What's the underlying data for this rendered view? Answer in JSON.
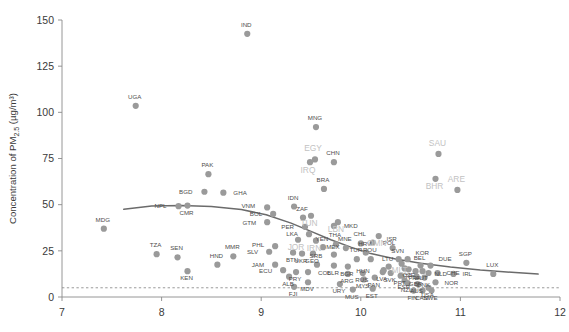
{
  "chart_data": {
    "type": "scatter",
    "title": "",
    "xlabel": "",
    "ylabel": "Concentration of PM2.5 (µg/m³)",
    "ylabel_parts": {
      "pre": "Concentration of PM",
      "sub": "2.5",
      "post": " (µg/m³)"
    },
    "xlim": [
      7,
      12
    ],
    "ylim": [
      0,
      150
    ],
    "xticks": [
      "7",
      "8",
      "9",
      "10",
      "11",
      "12"
    ],
    "yticks": [
      "0",
      "25",
      "50",
      "75",
      "100",
      "125",
      "150"
    ],
    "grid": false,
    "legend": "none",
    "guideline": {
      "label": "WHO guideline",
      "y": 5,
      "style": "dashed"
    },
    "trendline": {
      "style": "solid",
      "color": "#6b6b6b",
      "points": [
        [
          7.62,
          47.5
        ],
        [
          7.9,
          49.2
        ],
        [
          8.2,
          49.6
        ],
        [
          8.5,
          49.0
        ],
        [
          8.8,
          47.4
        ],
        [
          9.05,
          44.5
        ],
        [
          9.3,
          40.0
        ],
        [
          9.5,
          35.5
        ],
        [
          9.7,
          31.0
        ],
        [
          9.9,
          27.0
        ],
        [
          10.1,
          23.5
        ],
        [
          10.35,
          20.6
        ],
        [
          10.6,
          18.3
        ],
        [
          10.9,
          16.2
        ],
        [
          11.2,
          14.6
        ],
        [
          11.55,
          13.2
        ],
        [
          11.78,
          12.4
        ]
      ]
    },
    "points": [
      {
        "code": "MDG",
        "x": 7.42,
        "y": 37.0,
        "lx": -1,
        "ly": -7,
        "hl": false
      },
      {
        "code": "UGA",
        "x": 7.74,
        "y": 103.5,
        "lx": -1,
        "ly": -7,
        "hl": false
      },
      {
        "code": "TZA",
        "x": 7.95,
        "y": 23.2,
        "lx": -1,
        "ly": -7,
        "hl": false
      },
      {
        "code": "NPL",
        "x": 8.17,
        "y": 49.2,
        "lx": -12,
        "ly": 2,
        "hl": false
      },
      {
        "code": "CMR",
        "x": 8.26,
        "y": 49.5,
        "lx": -1,
        "ly": 9,
        "hl": false
      },
      {
        "code": "SEN",
        "x": 8.16,
        "y": 21.5,
        "lx": -1,
        "ly": -7,
        "hl": false
      },
      {
        "code": "KEN",
        "x": 8.26,
        "y": 14.0,
        "lx": -1,
        "ly": 9,
        "hl": false
      },
      {
        "code": "PAK",
        "x": 8.47,
        "y": 66.5,
        "lx": -1,
        "ly": -7,
        "hl": false
      },
      {
        "code": "BGD",
        "x": 8.43,
        "y": 57.0,
        "lx": -12,
        "ly": 2,
        "hl": false
      },
      {
        "code": "GHA",
        "x": 8.62,
        "y": 56.5,
        "lx": 10,
        "ly": 2.5,
        "hl": false
      },
      {
        "code": "MMR",
        "x": 8.72,
        "y": 22.0,
        "lx": -1,
        "ly": -7,
        "hl": false
      },
      {
        "code": "HND",
        "x": 8.56,
        "y": 17.5,
        "lx": -1,
        "ly": -7,
        "hl": false
      },
      {
        "code": "IND",
        "x": 8.86,
        "y": 142.5,
        "lx": -1,
        "ly": -7,
        "hl": false
      },
      {
        "code": "VNM",
        "x": 9.06,
        "y": 48.5,
        "lx": -12,
        "ly": 1,
        "hl": false
      },
      {
        "code": "BOL",
        "x": 9.12,
        "y": 45.0,
        "lx": -11,
        "ly": 2,
        "hl": false
      },
      {
        "code": "GTM",
        "x": 9.06,
        "y": 40.5,
        "lx": -11,
        "ly": 3,
        "hl": false
      },
      {
        "code": "PHL",
        "x": 9.14,
        "y": 27.5,
        "lx": -11,
        "ly": 1,
        "hl": false
      },
      {
        "code": "SLV",
        "x": 9.08,
        "y": 24.5,
        "lx": -11,
        "ly": 2,
        "hl": false
      },
      {
        "code": "JAM",
        "x": 9.14,
        "y": 17.5,
        "lx": -11,
        "ly": 2,
        "hl": false
      },
      {
        "code": "ECU",
        "x": 9.22,
        "y": 14.5,
        "lx": -11,
        "ly": 3,
        "hl": false
      },
      {
        "code": "IDN",
        "x": 9.33,
        "y": 49.0,
        "lx": -1,
        "ly": -7,
        "hl": false
      },
      {
        "code": "ZAF",
        "x": 9.42,
        "y": 43.0,
        "lx": -1,
        "ly": -7,
        "hl": false
      },
      {
        "code": "PER",
        "x": 9.44,
        "y": 38.0,
        "lx": -11,
        "ly": 2,
        "hl": false
      },
      {
        "code": "LKA",
        "x": 9.48,
        "y": 34.0,
        "lx": -11,
        "ly": 2,
        "hl": false
      },
      {
        "code": "BTN",
        "x": 9.32,
        "y": 24.0,
        "lx": -1,
        "ly": 9,
        "hl": false
      },
      {
        "code": "UKR",
        "x": 9.41,
        "y": 23.5,
        "lx": -1,
        "ly": 9,
        "hl": false
      },
      {
        "code": "GEO",
        "x": 9.52,
        "y": 23.5,
        "lx": -1,
        "ly": 9,
        "hl": false
      },
      {
        "code": "PRY",
        "x": 9.35,
        "y": 13.5,
        "lx": -1,
        "ly": 9,
        "hl": false
      },
      {
        "code": "ALB",
        "x": 9.28,
        "y": 11.0,
        "lx": -1,
        "ly": 9,
        "hl": false
      },
      {
        "code": "COL",
        "x": 9.47,
        "y": 13.5,
        "lx": 10,
        "ly": 2.5,
        "hl": false
      },
      {
        "code": "SRB",
        "x": 9.56,
        "y": 17.5,
        "lx": -1,
        "ly": -7,
        "hl": false
      },
      {
        "code": "MDV",
        "x": 9.47,
        "y": 8.0,
        "lx": -1,
        "ly": 9,
        "hl": false
      },
      {
        "code": "FJI",
        "x": 9.33,
        "y": 5.5,
        "lx": -1,
        "ly": 9,
        "hl": false
      },
      {
        "code": "MNG",
        "x": 9.55,
        "y": 92.0,
        "lx": -1,
        "ly": -7,
        "hl": false
      },
      {
        "code": "EGY",
        "x": 9.54,
        "y": 74.5,
        "lx": -2,
        "ly": -8,
        "hl": true
      },
      {
        "code": "IRQ",
        "x": 9.49,
        "y": 73.0,
        "lx": -2,
        "ly": 11,
        "hl": true
      },
      {
        "code": "CHN",
        "x": 9.73,
        "y": 73.0,
        "lx": -1,
        "ly": -7,
        "hl": false
      },
      {
        "code": "BRA",
        "x": 9.63,
        "y": 58.5,
        "lx": -1,
        "ly": -7,
        "hl": false
      },
      {
        "code": "TUN",
        "x": 9.5,
        "y": 44.0,
        "lx": -2,
        "ly": 10,
        "hl": true
      },
      {
        "code": "JOR",
        "x": 9.37,
        "y": 31.0,
        "lx": -2,
        "ly": 10,
        "hl": true
      },
      {
        "code": "IRN",
        "x": 9.55,
        "y": 30.5,
        "lx": -2,
        "ly": 10,
        "hl": true
      },
      {
        "code": "LBN",
        "x": 9.77,
        "y": 40.5,
        "lx": -2,
        "ly": 10,
        "hl": true
      },
      {
        "code": "MKD",
        "x": 9.73,
        "y": 38.5,
        "lx": 10,
        "ly": 2.5,
        "hl": false
      },
      {
        "code": "YEN",
        "x": 9.62,
        "y": 27.0,
        "lx": -1,
        "ly": -6,
        "hl": false
      },
      {
        "code": "THA",
        "x": 9.75,
        "y": 28.5,
        "lx": -1,
        "ly": -7,
        "hl": false
      },
      {
        "code": "MNE",
        "x": 9.85,
        "y": 26.5,
        "lx": -1,
        "ly": -7,
        "hl": false
      },
      {
        "code": "MEX",
        "x": 9.73,
        "y": 23.0,
        "lx": -1,
        "ly": -6,
        "hl": false
      },
      {
        "code": "BLR",
        "x": 9.73,
        "y": 17.0,
        "lx": -1,
        "ly": 9,
        "hl": false
      },
      {
        "code": "BGR",
        "x": 9.87,
        "y": 16.5,
        "lx": -1,
        "ly": 9,
        "hl": false
      },
      {
        "code": "ARG",
        "x": 9.87,
        "y": 12.5,
        "lx": -1,
        "ly": 9,
        "hl": false
      },
      {
        "code": "URY",
        "x": 9.79,
        "y": 7.0,
        "lx": -1,
        "ly": 9,
        "hl": false
      },
      {
        "code": "MUS",
        "x": 9.92,
        "y": 4.0,
        "lx": -1,
        "ly": 9,
        "hl": false
      },
      {
        "code": "CHL",
        "x": 10.0,
        "y": 29.0,
        "lx": -1,
        "ly": -7,
        "hl": false
      },
      {
        "code": "POL",
        "x": 10.12,
        "y": 29.5,
        "lx": 10,
        "ly": 2.5,
        "hl": false
      },
      {
        "code": "HRV",
        "x": 10.05,
        "y": 24.0,
        "lx": -1,
        "ly": -7,
        "hl": false
      },
      {
        "code": "TUR",
        "x": 9.96,
        "y": 20.5,
        "lx": -1,
        "ly": -7,
        "hl": false
      },
      {
        "code": "ROU",
        "x": 10.1,
        "y": 20.5,
        "lx": -1,
        "ly": -7,
        "hl": false
      },
      {
        "code": "RUS",
        "x": 10.02,
        "y": 13.0,
        "lx": -1,
        "ly": 9,
        "hl": false
      },
      {
        "code": "MYS",
        "x": 10.03,
        "y": 9.5,
        "lx": -1,
        "ly": 9,
        "hl": false
      },
      {
        "code": "PAN",
        "x": 10.14,
        "y": 10.5,
        "lx": -1,
        "ly": 9,
        "hl": false
      },
      {
        "code": "EST",
        "x": 10.12,
        "y": 4.5,
        "lx": -1,
        "ly": 9,
        "hl": false
      },
      {
        "code": "OMN",
        "x": 10.18,
        "y": 33.0,
        "lx": -2,
        "ly": 10,
        "hl": true
      },
      {
        "code": "ISR",
        "x": 10.32,
        "y": 26.5,
        "lx": -1,
        "ly": -7,
        "hl": false
      },
      {
        "code": "SVN",
        "x": 10.38,
        "y": 20.5,
        "lx": -1,
        "ly": -6,
        "hl": false
      },
      {
        "code": "KOR",
        "x": 10.47,
        "y": 20.5,
        "lx": 8,
        "ly": -4,
        "hl": false
      },
      {
        "code": "LTU",
        "x": 10.28,
        "y": 16.5,
        "lx": -1,
        "ly": -6,
        "hl": false
      },
      {
        "code": "SVK",
        "x": 10.3,
        "y": 13.0,
        "lx": -1,
        "ly": 9,
        "hl": false
      },
      {
        "code": "LVA",
        "x": 10.22,
        "y": 13.5,
        "lx": -1,
        "ly": 9,
        "hl": false
      },
      {
        "code": "MLT",
        "x": 10.41,
        "y": 18.0,
        "lx": -2,
        "ly": 9,
        "hl": true
      },
      {
        "code": "CZE",
        "x": 10.44,
        "y": 15.5,
        "lx": 4,
        "ly": 9,
        "hl": false
      },
      {
        "code": "ITA",
        "x": 10.48,
        "y": 15.0,
        "lx": -1,
        "ly": 9,
        "hl": false
      },
      {
        "code": "PRT",
        "x": 10.4,
        "y": 11.5,
        "lx": -1,
        "ly": 9,
        "hl": false
      },
      {
        "code": "ESP",
        "x": 10.44,
        "y": 9.0,
        "lx": -1,
        "ly": 9,
        "hl": false
      },
      {
        "code": "HUN",
        "x": 10.23,
        "y": 14.5,
        "lx": -14,
        "ly": 3,
        "hl": false
      },
      {
        "code": "BEL",
        "x": 10.6,
        "y": 17.0,
        "lx": -1,
        "ly": -6,
        "hl": false
      },
      {
        "code": "DUE",
        "x": 10.7,
        "y": 17.0,
        "lx": 8,
        "ly": -5,
        "hl": false
      },
      {
        "code": "FRA",
        "x": 10.55,
        "y": 14.0,
        "lx": -1,
        "ly": 9,
        "hl": false
      },
      {
        "code": "AUT",
        "x": 10.62,
        "y": 14.0,
        "lx": -1,
        "ly": 9,
        "hl": false
      },
      {
        "code": "NLD",
        "x": 10.68,
        "y": 13.0,
        "lx": 6,
        "ly": 3,
        "hl": false
      },
      {
        "code": "CHE",
        "x": 10.77,
        "y": 13.0,
        "lx": 9,
        "ly": 2.5,
        "hl": false
      },
      {
        "code": "GBR",
        "x": 10.56,
        "y": 11.0,
        "lx": -1,
        "ly": 9,
        "hl": false
      },
      {
        "code": "DNK",
        "x": 10.64,
        "y": 10.5,
        "lx": -1,
        "ly": 9,
        "hl": false
      },
      {
        "code": "NOR",
        "x": 10.75,
        "y": 8.0,
        "lx": 9,
        "ly": 2.5,
        "hl": false
      },
      {
        "code": "NZL",
        "x": 10.47,
        "y": 7.5,
        "lx": -1,
        "ly": 9,
        "hl": false
      },
      {
        "code": "AUS",
        "x": 10.57,
        "y": 7.0,
        "lx": -1,
        "ly": 9,
        "hl": false
      },
      {
        "code": "USA",
        "x": 10.68,
        "y": 5.0,
        "lx": -1,
        "ly": 9,
        "hl": false
      },
      {
        "code": "FIN",
        "x": 10.53,
        "y": 3.5,
        "lx": -1,
        "ly": 9,
        "hl": false
      },
      {
        "code": "CAN",
        "x": 10.62,
        "y": 3.5,
        "lx": -1,
        "ly": 9,
        "hl": false
      },
      {
        "code": "SWE",
        "x": 10.71,
        "y": 3.5,
        "lx": -1,
        "ly": 9,
        "hl": false
      },
      {
        "code": "IRL",
        "x": 10.93,
        "y": 12.5,
        "lx": 9,
        "ly": 2.5,
        "hl": false
      },
      {
        "code": "SGP",
        "x": 11.06,
        "y": 18.5,
        "lx": -1,
        "ly": -7,
        "hl": false
      },
      {
        "code": "SAU",
        "x": 10.78,
        "y": 77.5,
        "lx": -1,
        "ly": -8,
        "hl": true
      },
      {
        "code": "BHR",
        "x": 10.75,
        "y": 64.0,
        "lx": -1,
        "ly": 10,
        "hl": true
      },
      {
        "code": "ARE",
        "x": 10.97,
        "y": 58.0,
        "lx": -1,
        "ly": -8,
        "hl": true
      },
      {
        "code": "LUX",
        "x": 11.33,
        "y": 12.5,
        "lx": -1,
        "ly": -7,
        "hl": false
      }
    ]
  }
}
